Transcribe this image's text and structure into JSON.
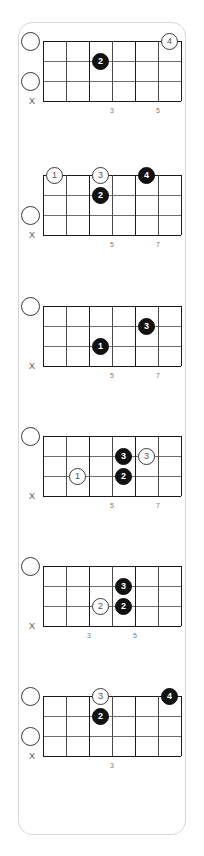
{
  "page": {
    "background_color": "#ffffff",
    "card_border_color": "#d8d8d8",
    "dot_filled_color": "#111111",
    "dot_open_color": "#ffffff",
    "string_color": "#6e6e6e",
    "fret_color": "#1a1a1a",
    "label_color": "#7a7a7a"
  },
  "diagram_defaults": {
    "strings": 4,
    "frets": 6,
    "muted_marker": "X"
  },
  "diagrams": [
    {
      "index": 1,
      "top": 18,
      "open_circles": [
        0,
        2
      ],
      "muted_marker": "X",
      "fret_labels": [
        {
          "fret": 3,
          "label": "3"
        },
        {
          "fret": 5,
          "label": "5"
        }
      ],
      "dots": [
        {
          "label": "2",
          "style": "filled",
          "string": 1,
          "fret": 3
        },
        {
          "label": "4",
          "style": "open",
          "string": 0,
          "fret": 6
        }
      ]
    },
    {
      "index": 2,
      "top": 152,
      "open_circles": [
        2
      ],
      "muted_marker": "X",
      "fret_labels": [
        {
          "fret": 3,
          "label": "5"
        },
        {
          "fret": 5,
          "label": "7"
        }
      ],
      "dots": [
        {
          "label": "1",
          "style": "open",
          "string": 0,
          "fret": 1
        },
        {
          "label": "3",
          "style": "open",
          "string": 0,
          "fret": 3
        },
        {
          "label": "2",
          "style": "filled",
          "string": 1,
          "fret": 3
        },
        {
          "label": "4",
          "style": "filled",
          "string": 0,
          "fret": 5
        }
      ]
    },
    {
      "index": 3,
      "top": 283,
      "open_circles": [
        0
      ],
      "muted_marker": "X",
      "fret_labels": [
        {
          "fret": 3,
          "label": "5"
        },
        {
          "fret": 5,
          "label": "7"
        }
      ],
      "dots": [
        {
          "label": "1",
          "style": "filled",
          "string": 2,
          "fret": 3
        },
        {
          "label": "3",
          "style": "filled",
          "string": 1,
          "fret": 5
        }
      ]
    },
    {
      "index": 4,
      "top": 413,
      "open_circles": [
        0
      ],
      "muted_marker": "X",
      "fret_labels": [
        {
          "fret": 3,
          "label": "5"
        },
        {
          "fret": 5,
          "label": "7"
        }
      ],
      "dots": [
        {
          "label": "1",
          "style": "open",
          "string": 2,
          "fret": 2
        },
        {
          "label": "3",
          "style": "filled",
          "string": 1,
          "fret": 4
        },
        {
          "label": "3",
          "style": "open",
          "string": 1,
          "fret": 5
        },
        {
          "label": "2",
          "style": "filled",
          "string": 2,
          "fret": 4
        }
      ]
    },
    {
      "index": 5,
      "top": 543,
      "open_circles": [
        0
      ],
      "muted_marker": "X",
      "fret_labels": [
        {
          "fret": 2,
          "label": "3"
        },
        {
          "fret": 4,
          "label": "5"
        }
      ],
      "dots": [
        {
          "label": "3",
          "style": "filled",
          "string": 1,
          "fret": 4
        },
        {
          "label": "2",
          "style": "open",
          "string": 2,
          "fret": 3
        },
        {
          "label": "2",
          "style": "filled",
          "string": 2,
          "fret": 4
        }
      ]
    },
    {
      "index": 6,
      "top": 673,
      "open_circles": [
        0,
        2
      ],
      "muted_marker": "X",
      "fret_labels": [
        {
          "fret": 3,
          "label": "3"
        }
      ],
      "dots": [
        {
          "label": "3",
          "style": "open",
          "string": 0,
          "fret": 3
        },
        {
          "label": "2",
          "style": "filled",
          "string": 1,
          "fret": 3
        },
        {
          "label": "4",
          "style": "filled",
          "string": 0,
          "fret": 6
        }
      ]
    }
  ]
}
